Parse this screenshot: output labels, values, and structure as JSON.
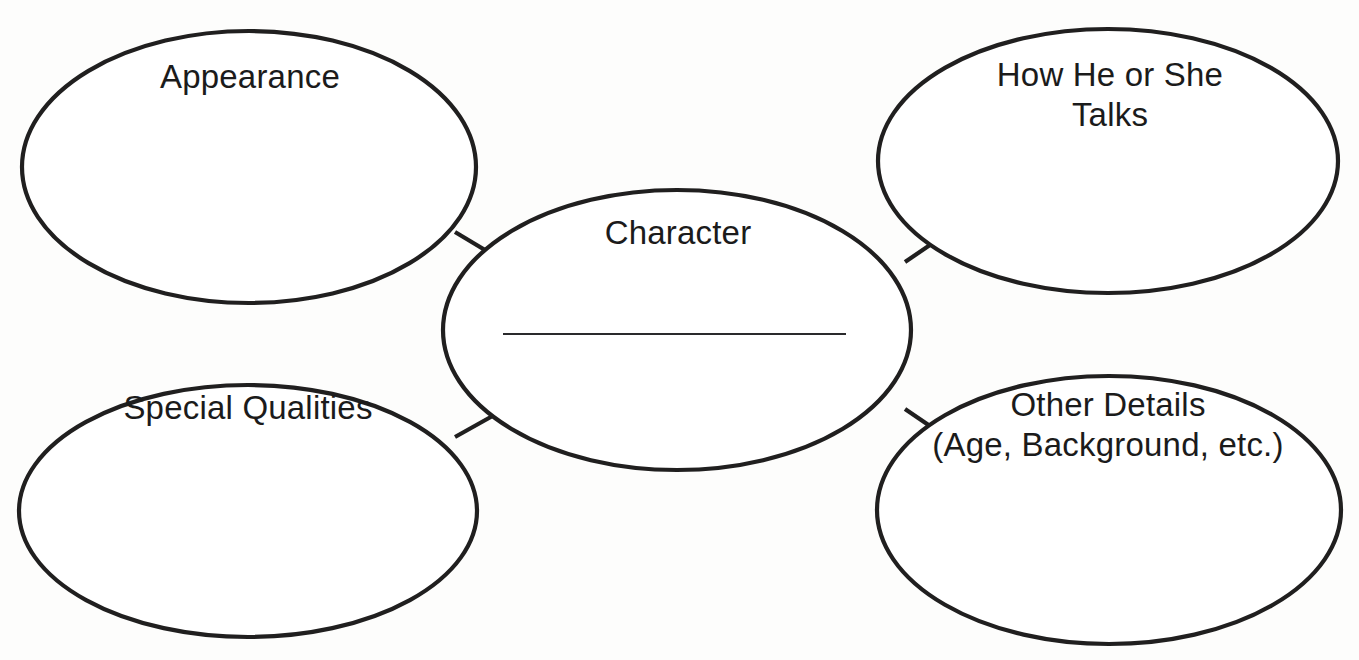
{
  "diagram": {
    "type": "character-web-graphic-organizer",
    "background_color": "#fdfdfc",
    "stroke_color": "#201f1f",
    "text_color": "#1b1b1b",
    "center": {
      "label": "Character",
      "has_write_in_line": true,
      "write_in_line_value": ""
    },
    "bubbles": [
      {
        "id": "appearance",
        "label": "Appearance",
        "position": "top-left"
      },
      {
        "id": "talks",
        "label": "How He or She\nTalks",
        "line1": "How He or She",
        "line2": "Talks",
        "position": "top-right"
      },
      {
        "id": "special-qualities",
        "label": "Special Qualities",
        "position": "bottom-left"
      },
      {
        "id": "other-details",
        "label": "Other Details\n(Age, Background, etc.)",
        "line1": "Other Details",
        "line2": "(Age, Background, etc.)",
        "position": "bottom-right"
      }
    ]
  }
}
